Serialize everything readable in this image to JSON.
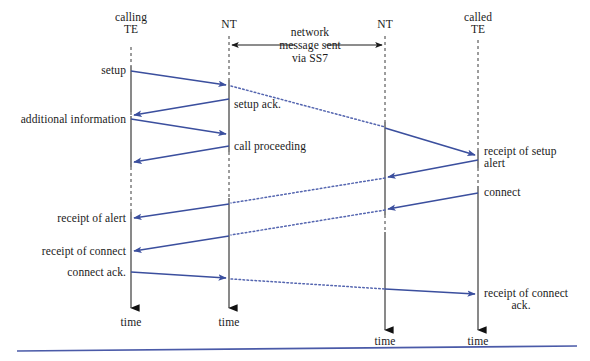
{
  "diagram": {
    "type": "sequence-diagram",
    "accent_color": "#3b4f9e",
    "lifeline_color": "#4a4a4a",
    "text_color": "#1a1a1a",
    "columns": [
      {
        "id": "calling-te",
        "label_line1": "calling",
        "label_line2": "TE",
        "x": 131,
        "style": "dashed-then-solid",
        "time_label": "time"
      },
      {
        "id": "nt-left",
        "label_line1": "NT",
        "label_line2": "",
        "x": 229,
        "style": "dashed-then-solid",
        "time_label": "time"
      },
      {
        "id": "nt-right",
        "label_line1": "NT",
        "label_line2": "",
        "x": 385,
        "style": "dashed-then-solid",
        "time_label": "time"
      },
      {
        "id": "called-te",
        "label_line1": "called",
        "label_line2": "TE",
        "x": 478,
        "style": "dashed-then-solid",
        "time_label": "time"
      }
    ],
    "network_note": {
      "line1": "network",
      "line2": "message sent",
      "line3": "via SS7",
      "arrow_left_x": 229,
      "arrow_right_x": 385,
      "arrow_y": 45
    },
    "messages": [
      {
        "id": "setup",
        "label": "setup",
        "label_side": "left-of-calling",
        "from_x": 131,
        "from_y": 71,
        "to_x": 229,
        "to_y": 85,
        "kind": "solid"
      },
      {
        "id": "setup-ack",
        "label": "setup ack.",
        "label_side": "right-of-nt-left",
        "from_x": 229,
        "from_y": 99,
        "to_x": 131,
        "to_y": 115,
        "kind": "solid"
      },
      {
        "id": "additional-information",
        "label": "additional information",
        "label_side": "left-of-calling",
        "from_x": 131,
        "from_y": 119,
        "to_x": 229,
        "to_y": 134,
        "kind": "solid"
      },
      {
        "id": "call-proceeding",
        "label": "call proceeding",
        "label_side": "right-of-nt-left",
        "from_x": 229,
        "from_y": 146,
        "to_x": 131,
        "to_y": 162,
        "kind": "solid"
      },
      {
        "id": "setup-to-network",
        "label": "",
        "label_side": "none",
        "from_x": 229,
        "from_y": 86,
        "to_x": 385,
        "to_y": 127,
        "kind": "dotted"
      },
      {
        "id": "receipt-of-setup",
        "label_line1": "receipt of setup",
        "label_line2": "alert",
        "label": "receipt of setup",
        "label_side": "right-of-called",
        "from_x": 385,
        "from_y": 128,
        "to_x": 478,
        "to_y": 155,
        "kind": "solid"
      },
      {
        "id": "alert-to-nt-right",
        "label": "",
        "label_side": "none",
        "from_x": 478,
        "from_y": 160,
        "to_x": 385,
        "to_y": 177,
        "kind": "solid"
      },
      {
        "id": "alert-network",
        "label": "",
        "label_side": "none",
        "from_x": 385,
        "from_y": 178,
        "to_x": 229,
        "to_y": 203,
        "kind": "dotted"
      },
      {
        "id": "receipt-of-alert",
        "label": "receipt of alert",
        "label_side": "left-of-calling",
        "from_x": 229,
        "from_y": 204,
        "to_x": 131,
        "to_y": 218,
        "kind": "solid"
      },
      {
        "id": "connect",
        "label": "connect",
        "label_side": "right-of-called",
        "from_x": 478,
        "from_y": 193,
        "to_x": 385,
        "to_y": 209,
        "kind": "solid"
      },
      {
        "id": "connect-network",
        "label": "",
        "label_side": "none",
        "from_x": 385,
        "from_y": 210,
        "to_x": 229,
        "to_y": 235,
        "kind": "dotted"
      },
      {
        "id": "receipt-of-connect",
        "label": "receipt of connect",
        "label_side": "left-of-calling",
        "from_x": 229,
        "from_y": 236,
        "to_x": 131,
        "to_y": 251,
        "kind": "solid"
      },
      {
        "id": "connect-ack",
        "label": "connect ack.",
        "label_side": "left-of-calling",
        "from_x": 131,
        "from_y": 272,
        "to_x": 229,
        "to_y": 278,
        "kind": "solid"
      },
      {
        "id": "connect-ack-network",
        "label": "",
        "label_side": "none",
        "from_x": 229,
        "from_y": 279,
        "to_x": 385,
        "to_y": 289,
        "kind": "dotted"
      },
      {
        "id": "receipt-of-connect-ack",
        "label_line1": "receipt of connect",
        "label_line2": "ack.",
        "label": "receipt of connect",
        "label_side": "right-of-called",
        "from_x": 385,
        "from_y": 289,
        "to_x": 478,
        "to_y": 294,
        "kind": "solid"
      }
    ],
    "labels": {
      "setup": "setup",
      "setup_ack": "setup ack.",
      "additional_information": "additional information",
      "call_proceeding": "call proceeding",
      "receipt_of_setup": "receipt of setup",
      "alert": "alert",
      "connect": "connect",
      "receipt_of_alert": "receipt of alert",
      "receipt_of_connect": "receipt of connect",
      "connect_ack": "connect ack.",
      "receipt_of_connect_ack": "receipt of connect",
      "ack": "ack.",
      "time": "time",
      "calling": "calling",
      "te": "TE",
      "nt": "NT",
      "called": "called",
      "network": "network",
      "message_sent": "message sent",
      "via_ss7": "via SS7"
    }
  }
}
